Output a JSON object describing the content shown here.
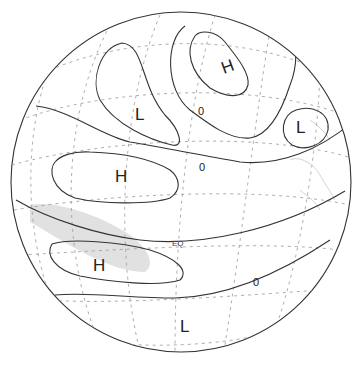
{
  "figure": {
    "type": "orthographic-globe-pressure-anomaly-map",
    "colors": {
      "background": "#ffffff",
      "contour": "#333333",
      "graticule": "#999999",
      "shading": "#d8d8d8",
      "coastline": "#cccccc"
    }
  },
  "labels": {
    "centers": [
      {
        "id": "high-north",
        "text": "H",
        "x": 231,
        "y": 65
      },
      {
        "id": "low-northwest",
        "text": "L",
        "x": 143,
        "y": 113
      },
      {
        "id": "low-east",
        "text": "L",
        "x": 302,
        "y": 127
      },
      {
        "id": "high-central",
        "text": "H",
        "x": 121,
        "y": 176
      },
      {
        "id": "high-south",
        "text": "H",
        "x": 100,
        "y": 265
      },
      {
        "id": "low-south",
        "text": "L",
        "x": 186,
        "y": 326
      }
    ],
    "zero_contours": [
      {
        "id": "zero-1",
        "text": "0",
        "x": 202,
        "y": 111
      },
      {
        "id": "zero-2",
        "text": "0",
        "x": 203,
        "y": 167
      },
      {
        "id": "zero-3",
        "text": "0",
        "x": 257,
        "y": 282
      }
    ],
    "equator": {
      "text": "EQ",
      "x": 177,
      "y": 243
    }
  }
}
